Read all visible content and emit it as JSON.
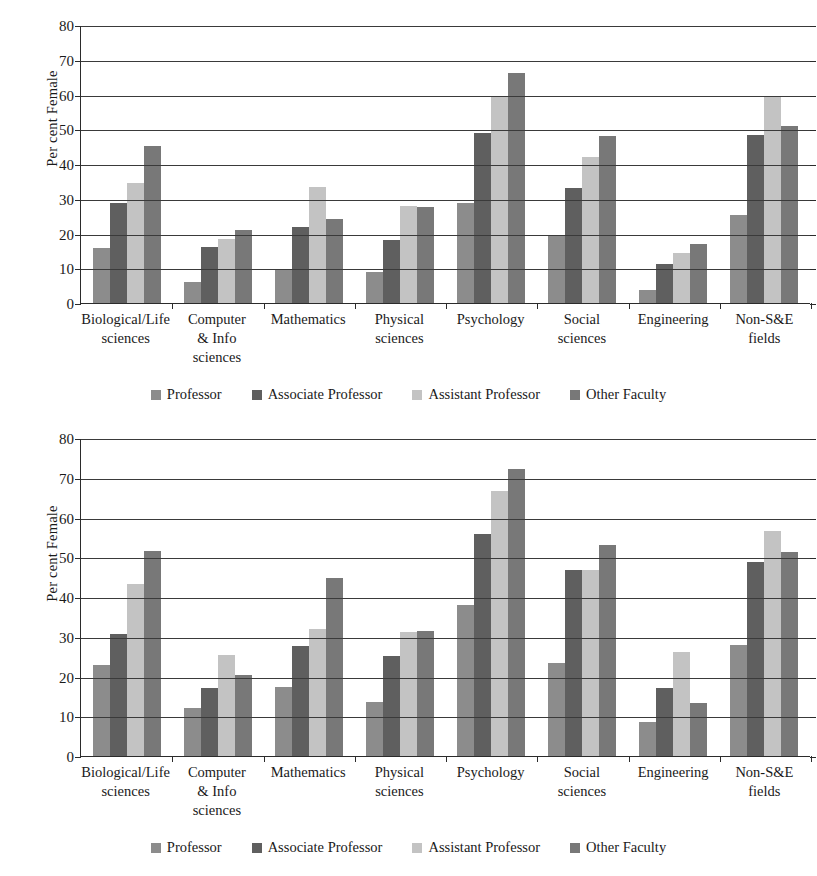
{
  "figure": {
    "title": "",
    "panels": [
      "top",
      "bottom"
    ]
  },
  "chart_data": [
    {
      "panel": "top",
      "type": "bar",
      "title": "",
      "xlabel": "",
      "ylabel": "Per cent Female",
      "ylim": [
        0,
        80
      ],
      "yticks": [
        0,
        10,
        20,
        30,
        40,
        50,
        60,
        70,
        80
      ],
      "grid": true,
      "legend_position": "bottom",
      "categories": [
        "Biological/Life sciences",
        "Computer & Info sciences",
        "Mathematics",
        "Physical sciences",
        "Psychology",
        "Social sciences",
        "Engineering",
        "Non-S&E fields"
      ],
      "series": [
        {
          "name": "Professor",
          "color": "#8c8c8c",
          "values": [
            15.7,
            6.0,
            9.6,
            8.9,
            28.8,
            19.3,
            3.8,
            25.2
          ]
        },
        {
          "name": "Associate Professor",
          "color": "#5f5f5f",
          "values": [
            28.8,
            16.2,
            22.0,
            18.1,
            48.9,
            33.1,
            11.1,
            48.3
          ]
        },
        {
          "name": "Assistant Professor",
          "color": "#c3c3c3",
          "values": [
            34.6,
            18.4,
            33.5,
            27.8,
            59.5,
            41.9,
            14.4,
            59.6
          ]
        },
        {
          "name": "Other Faculty",
          "color": "#787878",
          "values": [
            45.2,
            21.0,
            24.2,
            27.6,
            66.3,
            48.0,
            17.0,
            50.8
          ]
        }
      ]
    },
    {
      "panel": "bottom",
      "type": "bar",
      "title": "",
      "xlabel": "",
      "ylabel": "Per cent Female",
      "ylim": [
        0,
        80
      ],
      "yticks": [
        0,
        10,
        20,
        30,
        40,
        50,
        60,
        70,
        80
      ],
      "grid": true,
      "legend_position": "bottom",
      "categories": [
        "Biological/Life sciences",
        "Computer & Info sciences",
        "Mathematics",
        "Physical sciences",
        "Psychology",
        "Social sciences",
        "Engineering",
        "Non-S&E fields"
      ],
      "series": [
        {
          "name": "Professor",
          "color": "#8c8c8c",
          "values": [
            22.8,
            12.2,
            17.3,
            13.7,
            37.9,
            23.4,
            8.5,
            27.9
          ]
        },
        {
          "name": "Associate Professor",
          "color": "#5f5f5f",
          "values": [
            30.6,
            17.0,
            27.8,
            25.2,
            55.9,
            46.7,
            17.2,
            48.9
          ]
        },
        {
          "name": "Assistant Professor",
          "color": "#c3c3c3",
          "values": [
            43.4,
            25.3,
            32.0,
            31.2,
            66.6,
            46.9,
            26.1,
            56.5
          ]
        },
        {
          "name": "Other Faculty",
          "color": "#787878",
          "values": [
            51.7,
            20.4,
            44.7,
            31.4,
            72.1,
            53.0,
            13.4,
            51.3
          ]
        }
      ]
    }
  ],
  "labels": {
    "ylabel": "Per cent Female",
    "categories_multiline": [
      [
        "Biological/Life",
        "sciences"
      ],
      [
        "Computer",
        "& Info",
        "sciences"
      ],
      [
        "Mathematics"
      ],
      [
        "Physical",
        "sciences"
      ],
      [
        "Psychology"
      ],
      [
        "Social",
        "sciences"
      ],
      [
        "Engineering"
      ],
      [
        "Non-S&E",
        "fields"
      ]
    ],
    "legend": [
      {
        "label": "Professor",
        "color": "#8c8c8c"
      },
      {
        "label": "Associate Professor",
        "color": "#5f5f5f"
      },
      {
        "label": "Assistant Professor",
        "color": "#c3c3c3"
      },
      {
        "label": "Other Faculty",
        "color": "#787878"
      }
    ],
    "yticks": [
      "80",
      "70",
      "60",
      "50",
      "40",
      "30",
      "20",
      "10",
      "0"
    ]
  }
}
